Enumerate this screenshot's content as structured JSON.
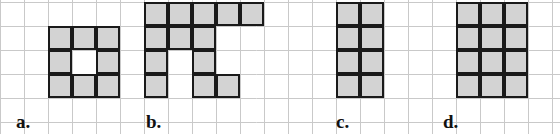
{
  "figure_sheet": {
    "title": "",
    "grid": {
      "cell_size_px": 24,
      "origin_x_px": 0,
      "origin_y_px": 2,
      "columns": 23,
      "rows": 6,
      "line_color": "#c9c9c9",
      "background_color": "#ffffff",
      "visible": true
    },
    "style": {
      "cell_fill": "#d3d3d3",
      "cell_stroke": "#1a1a1a",
      "cell_stroke_width_px": 2.5,
      "label_color": "#111111"
    },
    "figures": [
      {
        "label": "a.",
        "name": "figure-a",
        "label_x_px": 16,
        "label_y_px": 112,
        "origin_col": 2,
        "origin_row": 1,
        "cols": 3,
        "rows": 3,
        "filled_cell_count": 8,
        "cells": [
          [
            0,
            0
          ],
          [
            1,
            0
          ],
          [
            2,
            0
          ],
          [
            0,
            1
          ],
          [
            2,
            1
          ],
          [
            0,
            2
          ],
          [
            1,
            2
          ],
          [
            2,
            2
          ]
        ]
      },
      {
        "label": "b.",
        "name": "figure-b",
        "label_x_px": 146,
        "label_y_px": 112,
        "origin_col": 6,
        "origin_row": 0,
        "cols": 5,
        "rows": 4,
        "filled_cell_count": 11,
        "cells": [
          [
            0,
            0
          ],
          [
            1,
            0
          ],
          [
            2,
            0
          ],
          [
            3,
            0
          ],
          [
            4,
            0
          ],
          [
            0,
            1
          ],
          [
            1,
            1
          ],
          [
            2,
            1
          ],
          [
            0,
            2
          ],
          [
            2,
            2
          ],
          [
            0,
            3
          ],
          [
            2,
            3
          ],
          [
            3,
            3
          ]
        ]
      },
      {
        "label": "c.",
        "name": "figure-c",
        "label_x_px": 336,
        "label_y_px": 112,
        "origin_col": 14,
        "origin_row": 0,
        "cols": 2,
        "rows": 4,
        "filled_cell_count": 8,
        "cells": [
          [
            0,
            0
          ],
          [
            1,
            0
          ],
          [
            0,
            1
          ],
          [
            1,
            1
          ],
          [
            0,
            2
          ],
          [
            1,
            2
          ],
          [
            0,
            3
          ],
          [
            1,
            3
          ]
        ]
      },
      {
        "label": "d.",
        "name": "figure-d",
        "label_x_px": 443,
        "label_y_px": 112,
        "origin_col": 19,
        "origin_row": 0,
        "cols": 3,
        "rows": 4,
        "filled_cell_count": 12,
        "cells": [
          [
            0,
            0
          ],
          [
            1,
            0
          ],
          [
            2,
            0
          ],
          [
            0,
            1
          ],
          [
            1,
            1
          ],
          [
            2,
            1
          ],
          [
            0,
            2
          ],
          [
            1,
            2
          ],
          [
            2,
            2
          ],
          [
            0,
            3
          ],
          [
            1,
            3
          ],
          [
            2,
            3
          ]
        ]
      }
    ]
  }
}
